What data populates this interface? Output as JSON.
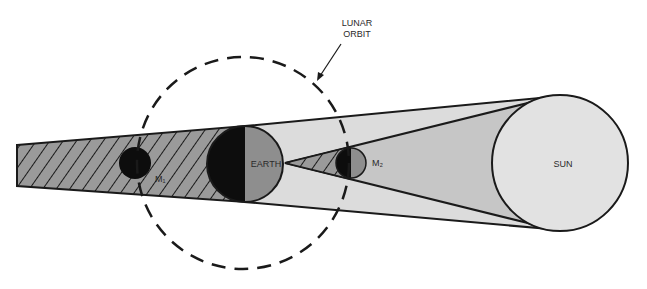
{
  "diagram": {
    "labels": {
      "lunar_orbit_line1": "LUNAR",
      "lunar_orbit_line2": "ORBIT",
      "earth": "EARTH",
      "sun": "SUN",
      "moon1": "M₁",
      "moon2": "M₂"
    },
    "colors": {
      "background": "#ffffff",
      "penumbra": "#dcdcdc",
      "inner_cone": "#c6c6c6",
      "hatched_fill": "#9a9a9a",
      "hatch_line": "#1a1a1a",
      "earth_day": "#8e8e8e",
      "earth_night": "#0d0d0d",
      "sun": "#e2e2e2",
      "outline": "#1a1a1a"
    }
  }
}
